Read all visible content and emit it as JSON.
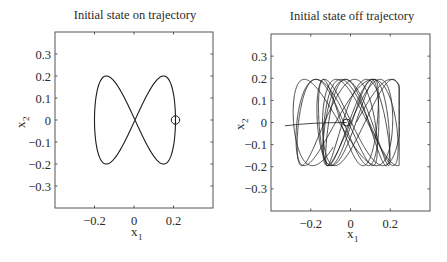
{
  "chart_data": [
    {
      "type": "line",
      "title": "Initial state on trajectory",
      "xlabel": "x_1",
      "ylabel": "x_2",
      "xlim": [
        -0.4,
        0.4
      ],
      "ylim": [
        -0.4,
        0.4
      ],
      "xticks": [
        -0.2,
        0,
        0.2
      ],
      "xtick_labels": [
        "−0.2",
        "0",
        "0.2"
      ],
      "yticks": [
        0.3,
        0.2,
        0.1,
        0,
        -0.1,
        -0.2,
        -0.3
      ],
      "ytick_labels": [
        "0.3",
        "0.2",
        "0.1",
        "0",
        "−0.1",
        "−0.2",
        "−0.3"
      ],
      "grid": false,
      "series": [
        {
          "name": "periodic figure-eight orbit",
          "param": "x = 0.205 sin(t), y = 0.2 sin(2t)",
          "x_range": [
            -0.2,
            0.21
          ],
          "y_range": [
            -0.2,
            0.2
          ]
        }
      ],
      "initial_state_marker": {
        "x": 0.21,
        "y": 0.0,
        "shape": "circle"
      }
    },
    {
      "type": "line",
      "title": "Initial state off trajectory",
      "xlabel": "x_1",
      "ylabel": "x_2",
      "xlim": [
        -0.4,
        0.4
      ],
      "ylim": [
        -0.4,
        0.4
      ],
      "xticks": [
        -0.2,
        0,
        0.2
      ],
      "xtick_labels": [
        "−0.2",
        "0",
        "0.2"
      ],
      "yticks": [
        0.3,
        0.2,
        0.1,
        0,
        -0.1,
        -0.2,
        -0.3
      ],
      "ytick_labels": [
        "0.3",
        "0.2",
        "0.1",
        "0",
        "−0.1",
        "−0.2",
        "−0.3"
      ],
      "grid": false,
      "series": [
        {
          "name": "chaotic trajectory (multiple overlapping figure-eight loops)",
          "x_range": [
            -0.33,
            0.24
          ],
          "y_range": [
            -0.2,
            0.2
          ]
        }
      ],
      "initial_state_marker": {
        "x": -0.02,
        "y": 0.0,
        "shape": "circle"
      }
    }
  ],
  "left": {
    "title": "Initial state on trajectory",
    "xlabel": "x",
    "xlabel_sub": "1",
    "ylabel": "x",
    "ylabel_sub": "2"
  },
  "right": {
    "title": "Initial state off trajectory",
    "xlabel": "x",
    "xlabel_sub": "1",
    "ylabel": "x",
    "ylabel_sub": "2"
  }
}
